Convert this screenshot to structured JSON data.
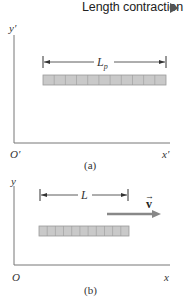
{
  "header": {
    "title": "Length contraction",
    "nav_icon": "right-triangle-icon"
  },
  "panels": [
    {
      "id": "a",
      "caption": "(a)",
      "y_axis_label": "y′",
      "x_axis_label": "x′",
      "origin_label": "O′",
      "length_label": "L",
      "length_subscript": "p",
      "segments": 11
    },
    {
      "id": "b",
      "caption": "(b)",
      "y_axis_label": "y",
      "x_axis_label": "x",
      "origin_label": "O",
      "length_label": "L",
      "velocity_label": "v",
      "velocity_arrow": "→",
      "segments": 11
    }
  ],
  "colors": {
    "axis": "#777777",
    "bar_fill": "#c9c9c9",
    "bar_border": "#9a9a9a",
    "velocity_arrow": "#888888",
    "text": "#222222"
  }
}
